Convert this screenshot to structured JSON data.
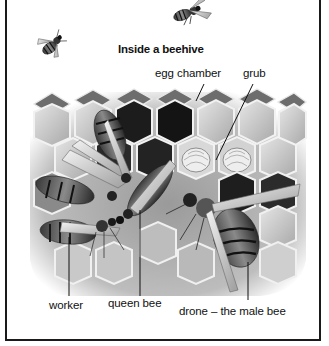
{
  "figure": {
    "title": "Inside a beehive",
    "labels": {
      "egg_chamber": "egg chamber",
      "grub": "grub",
      "worker": "worker",
      "queen_bee": "queen bee",
      "drone": "drone – the male bee"
    },
    "illustrations": [
      "flying-bee-top",
      "flying-bee-left",
      "honeycomb-with-bees"
    ],
    "colors": {
      "ink": "#111111",
      "frame": "#1a1a1a",
      "comb_light": "#d9d9d9",
      "comb_dark": "#1c1c1c",
      "background": "#ffffff"
    }
  }
}
